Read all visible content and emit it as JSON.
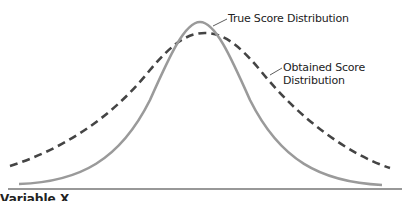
{
  "diagram": {
    "type": "overlapping-normal-distributions",
    "curves": [
      {
        "name": "True Score Distribution",
        "style": "solid",
        "color": "#9a9a9a",
        "peak": [
          200,
          22
        ],
        "start": [
          19,
          184
        ],
        "end": [
          382,
          185
        ]
      },
      {
        "name": "Obtained Score Distribution",
        "style": "dashed",
        "color": "#444444",
        "peak": [
          205,
          33
        ],
        "start": [
          10,
          166
        ],
        "end": [
          390,
          168
        ]
      }
    ],
    "baseline": {
      "y": 189,
      "x_start": 8,
      "x_end": 402,
      "color": "#333333"
    }
  },
  "labels": {
    "true_score": "True Score Distribution",
    "obtained_line1": "Obtained Score",
    "obtained_line2": "Distribution"
  },
  "footer": {
    "partial_text": "Variable X"
  }
}
